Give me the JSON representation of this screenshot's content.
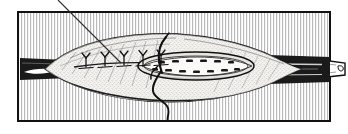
{
  "figure": {
    "name": "muscle-repair-suture-illustration",
    "style": "black-and-white engraving / stipple line art",
    "caption_text": "",
    "label_text": "",
    "frame": {
      "name": "illustration-border",
      "x": 17,
      "y": 11,
      "width": 314,
      "height": 111,
      "stroke_color": "#111111",
      "stroke_width": 2,
      "fill_color": "#ffffff"
    },
    "background": {
      "name": "vertical-hatching",
      "pattern": "vertical-lines",
      "line_color": "#b9b9b9",
      "line_width": 1,
      "period": 3,
      "base_color": "#ffffff"
    },
    "leader_line": {
      "name": "callout-leader-line",
      "x1": 58,
      "y1": 0,
      "x2": 121,
      "y2": 63,
      "stroke_color": "#2a2a2a",
      "stroke_width": 1
    },
    "colors": {
      "ink": "#111111",
      "dark_tendon": "#1a1a1a",
      "mid_shadow": "#585858",
      "light_tissue": "#f2f0ed",
      "stipple": "#3a3a3a",
      "hatch": "#b9b9b9",
      "paper": "#ffffff"
    },
    "anatomy": {
      "muscle_belly": {
        "name": "muscle-belly",
        "description": "fusiform muscle belly spanning the frame horizontally",
        "x_start": 45,
        "x_end": 302,
        "y_center": 68,
        "max_half_height": 26
      },
      "left_tendon": {
        "name": "left-tendon-stump",
        "x_start": 24,
        "x_end": 62,
        "y_center": 70,
        "fill": "#1a1a1a",
        "highlight": "#ffffff"
      },
      "right_tendon": {
        "name": "right-tendon",
        "x_start": 278,
        "x_end": 345,
        "y_center": 68,
        "fill": "#1a1a1a",
        "tip_fill": "#ffffff",
        "extends_past_frame": true
      },
      "incision": {
        "name": "longitudinal-incision",
        "x_start": 74,
        "x_end": 268,
        "y": 66
      },
      "open_wound": {
        "name": "open-wound-lens",
        "description": "lens / almond shaped open wound exposing cut muscle fibres",
        "cx": 196,
        "cy": 66,
        "rx": 58,
        "ry": 13,
        "fiber_rows": 2,
        "fiber_dots_per_row": 7
      }
    },
    "sutures": {
      "name": "interrupted-sutures",
      "count": 5,
      "shape": "Y-knot",
      "stroke_color": "#111111",
      "positions_x": [
        86,
        105,
        124,
        143,
        161
      ],
      "bar_y": 68,
      "knot_top_y": 55
    },
    "needle": {
      "name": "curved-suture-needle",
      "x": 163,
      "y_top": 38,
      "y_bottom": 72,
      "curved": true,
      "stroke_color": "#111111",
      "stroke_width": 2
    },
    "thread": {
      "name": "suture-thread",
      "description": "S-curved trailing thread hanging below the wound",
      "start_x": 160,
      "start_y": 70,
      "end_x": 168,
      "end_y": 121,
      "stroke_color": "#111111",
      "stroke_width": 2
    }
  }
}
